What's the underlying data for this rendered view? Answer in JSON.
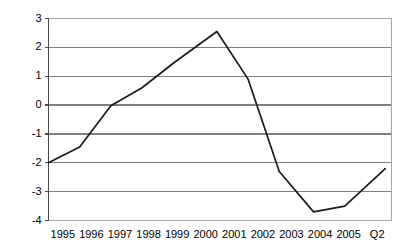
{
  "chart_data": {
    "type": "line",
    "title": "",
    "subtitle": "",
    "xlabel": "",
    "ylabel": "",
    "grid": true,
    "legend": "none",
    "categories": [
      "1995",
      "1996",
      "1997",
      "1998",
      "1999",
      "2000",
      "2001",
      "2002",
      "2003",
      "2004",
      "2005",
      "Q2"
    ],
    "ylim": [
      -4,
      3
    ],
    "yticks": [
      "3",
      "2",
      "1",
      "0",
      "-1",
      "-2",
      "-3",
      "-4"
    ],
    "ytick_values": [
      3,
      2,
      1,
      0,
      -1,
      -2,
      -3,
      -4
    ],
    "xlim": [
      1995,
      2006
    ],
    "series": [
      {
        "name": "series-1",
        "color": "#1a1a1a",
        "points": [
          {
            "x": 1995.0,
            "y": -2.0
          },
          {
            "x": 1996.0,
            "y": -1.45
          },
          {
            "x": 1997.0,
            "y": -0.02
          },
          {
            "x": 1998.0,
            "y": 0.6
          },
          {
            "x": 1999.0,
            "y": 1.45
          },
          {
            "x": 2000.4,
            "y": 2.55
          },
          {
            "x": 2001.4,
            "y": 0.9
          },
          {
            "x": 2002.4,
            "y": -2.3
          },
          {
            "x": 2003.5,
            "y": -3.7
          },
          {
            "x": 2004.5,
            "y": -3.5
          },
          {
            "x": 2005.8,
            "y": -2.2
          }
        ]
      }
    ]
  },
  "axes": {
    "gridline_color": "#808080",
    "axis_color": "#4d4d4d",
    "plot_border_color": "#a6a6a6",
    "background": "#ffffff"
  }
}
